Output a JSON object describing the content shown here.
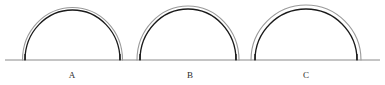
{
  "figure": {
    "type": "geometric-diagram",
    "background_color": "#ffffff",
    "width": 385,
    "height": 85
  },
  "baseline": {
    "name": "ground-line",
    "x_start": 5,
    "x_end": 380,
    "y": 60,
    "color": "#8a8a8a",
    "thickness": 1
  },
  "style": {
    "inner_curve_color": "#1a1a1a",
    "inner_curve_width": 1.3,
    "outer_curve_color": "#9a9a9a",
    "outer_curve_width": 1.1,
    "leg_color": "#1a1a1a",
    "label_color": "#2b2b2b"
  },
  "arches": [
    {
      "label": "A",
      "left_x": 25,
      "right_x": 120,
      "span": 95,
      "apex_y": 10,
      "height": 50,
      "offset": 2.5,
      "label_x": 72,
      "label_y": 71
    },
    {
      "label": "B",
      "left_x": 140,
      "right_x": 236,
      "span": 96,
      "apex_y": 9,
      "height": 51,
      "offset": 3,
      "label_x": 190,
      "label_y": 71
    },
    {
      "label": "C",
      "left_x": 255,
      "right_x": 357,
      "span": 102,
      "apex_y": 9,
      "height": 51,
      "offset": 4,
      "label_x": 306,
      "label_y": 71
    }
  ],
  "chart_data": {
    "type": "diagram",
    "categories": [
      "A",
      "B",
      "C"
    ],
    "series": [
      {
        "name": "span",
        "values": [
          95,
          96,
          102
        ]
      },
      {
        "name": "height",
        "values": [
          50,
          51,
          51
        ]
      },
      {
        "name": "outer_offset",
        "values": [
          2.5,
          3,
          4
        ]
      }
    ],
    "xlabel": "",
    "ylabel": "",
    "grid": false,
    "legend": "none"
  }
}
